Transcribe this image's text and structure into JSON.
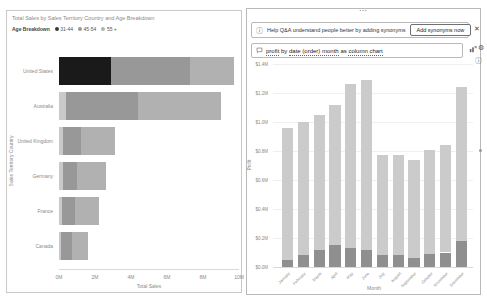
{
  "icons": {
    "info": "ⓘ",
    "close": "✕",
    "ellipsis": "⋯",
    "gear": "⚙"
  },
  "left_visual": {
    "title": "Total Sales by Sales Territory Country and Age Breakdown",
    "legend_title": "Age Breakdown"
  },
  "qa": {
    "banner_text": "Help Q&A understand people better by adding synonyms",
    "add_synonyms_button": "Add synonyms now",
    "question_tokens": [
      {
        "text": "profit",
        "underline": true
      },
      {
        "text": " by ",
        "underline": false
      },
      {
        "text": "date (order) month",
        "underline": true
      },
      {
        "text": " as ",
        "underline": false
      },
      {
        "text": "column chart",
        "underline": true
      }
    ]
  },
  "chart_data": [
    {
      "type": "bar",
      "orientation": "horizontal",
      "stacked": true,
      "title": "Total Sales by Sales Territory Country and Age Breakdown",
      "legend_title": "Age Breakdown",
      "categories": [
        "United States",
        "Australia",
        "United Kingdom",
        "Germany",
        "France",
        "Canada"
      ],
      "series": [
        {
          "name": "31-44",
          "color": "#c9c9c9",
          "highlight_color": "#1a1a1a",
          "highlight_category": "United States",
          "values": [
            2.9,
            0.4,
            0.2,
            0.2,
            0.15,
            0.1
          ]
        },
        {
          "name": "45-54",
          "color": "#989898",
          "values": [
            4.4,
            4.0,
            1.0,
            0.8,
            0.75,
            0.6
          ]
        },
        {
          "name": "55 +",
          "color": "#b1b1b1",
          "values": [
            2.4,
            4.6,
            1.9,
            1.6,
            1.3,
            0.9
          ]
        }
      ],
      "xlabel": "Total Sales",
      "ylabel": "Sales Territory Country",
      "xlim": [
        0,
        10
      ],
      "x_ticks": [
        "0M",
        "2M",
        "4M",
        "6M",
        "8M",
        "10M"
      ],
      "legend_position": "top",
      "grid": false
    },
    {
      "type": "bar",
      "orientation": "vertical",
      "stacked": true,
      "title": "profit by date (order) month as column chart",
      "categories": [
        "January",
        "February",
        "March",
        "April",
        "May",
        "June",
        "July",
        "August",
        "September",
        "October",
        "November",
        "December"
      ],
      "series": [
        {
          "name": "base",
          "color": "#8f8f8f",
          "values": [
            0.05,
            0.08,
            0.12,
            0.15,
            0.13,
            0.12,
            0.08,
            0.08,
            0.06,
            0.09,
            0.1,
            0.18
          ]
        },
        {
          "name": "top",
          "color": "#cbcbcb",
          "values": [
            0.91,
            0.92,
            0.93,
            0.97,
            1.13,
            1.17,
            0.69,
            0.69,
            0.68,
            0.72,
            0.74,
            1.06
          ]
        }
      ],
      "totals": [
        0.96,
        1.0,
        1.05,
        1.12,
        1.26,
        1.29,
        0.77,
        0.77,
        0.74,
        0.81,
        0.84,
        1.24
      ],
      "xlabel": "Month",
      "ylabel": "Profit",
      "ylim": [
        0,
        1.4
      ],
      "y_ticks": [
        "$0.0M",
        "$0.2M",
        "$0.4M",
        "$0.6M",
        "$0.8M",
        "$1.0M",
        "$1.2M",
        "$1.4M"
      ],
      "legend_position": "none",
      "grid": true
    }
  ]
}
